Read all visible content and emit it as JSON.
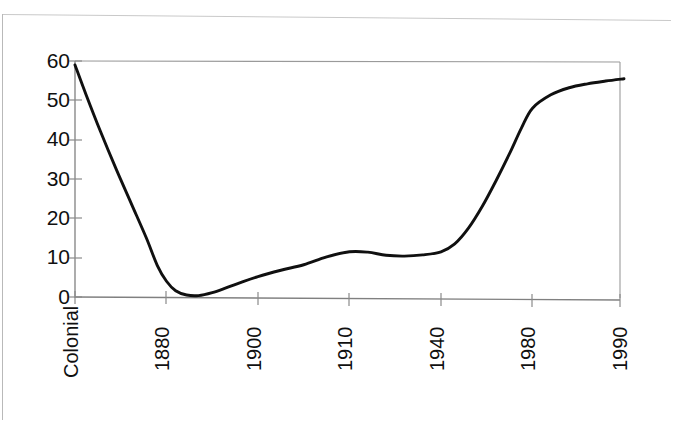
{
  "chart_data": {
    "type": "line",
    "title": "",
    "subtitle": "",
    "xlabel": "",
    "ylabel": "",
    "categories": [
      "Colonial",
      "1880",
      "1900",
      "1910",
      "1940",
      "1980",
      "1990"
    ],
    "values": [
      59,
      1,
      5,
      11.5,
      11.5,
      48,
      55.5
    ],
    "series": [
      {
        "name": "",
        "values": [
          59,
          1,
          5,
          11.5,
          11.5,
          48,
          55.5
        ]
      }
    ],
    "ylim": [
      0,
      60
    ],
    "yticks": [
      0,
      10,
      20,
      30,
      40,
      50,
      60
    ],
    "ytick_labels": [
      "0",
      "10",
      "20",
      "30",
      "40",
      "50",
      "60"
    ],
    "xtick_labels": [
      "Colonial",
      "1880",
      "1900",
      "1910",
      "1940",
      "1980",
      "1990"
    ],
    "grid": false,
    "legend": null,
    "legend_position": "none",
    "line_color": "#101010",
    "axis_color": "#808080",
    "background_color": "#ffffff",
    "annotations": [],
    "curve_points": [
      [
        0.0,
        59.0
      ],
      [
        0.12,
        51.5
      ],
      [
        0.28,
        42.0
      ],
      [
        0.45,
        32.5
      ],
      [
        0.62,
        23.5
      ],
      [
        0.78,
        15.0
      ],
      [
        0.9,
        8.0
      ],
      [
        1.0,
        4.0
      ],
      [
        1.1,
        1.6
      ],
      [
        1.22,
        0.5
      ],
      [
        1.35,
        0.35
      ],
      [
        1.5,
        1.1
      ],
      [
        1.65,
        2.3
      ],
      [
        1.8,
        3.6
      ],
      [
        2.0,
        5.2
      ],
      [
        2.25,
        6.8
      ],
      [
        2.5,
        8.2
      ],
      [
        2.75,
        10.2
      ],
      [
        3.0,
        11.5
      ],
      [
        3.2,
        11.4
      ],
      [
        3.4,
        10.6
      ],
      [
        3.6,
        10.4
      ],
      [
        3.8,
        10.7
      ],
      [
        4.0,
        11.5
      ],
      [
        4.15,
        13.5
      ],
      [
        4.3,
        17.5
      ],
      [
        4.45,
        23.0
      ],
      [
        4.6,
        29.5
      ],
      [
        4.75,
        36.5
      ],
      [
        4.88,
        43.0
      ],
      [
        5.0,
        48.0
      ],
      [
        5.2,
        51.4
      ],
      [
        5.4,
        53.2
      ],
      [
        5.6,
        54.2
      ],
      [
        5.8,
        54.9
      ],
      [
        6.0,
        55.5
      ]
    ]
  },
  "axes": {
    "y_axis_name": "value-axis",
    "x_axis_name": "period-axis"
  }
}
